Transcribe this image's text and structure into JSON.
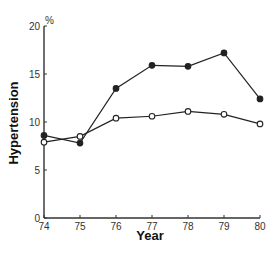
{
  "chart_data": {
    "type": "line",
    "title": "",
    "xlabel": "Year",
    "ylabel": "Hypertension",
    "y_unit": "%",
    "x": [
      74,
      75,
      76,
      77,
      78,
      79,
      80
    ],
    "x_tick_labels": [
      "74",
      "75",
      "76",
      "77",
      "78",
      "79",
      "80"
    ],
    "y_ticks": [
      0,
      5,
      10,
      15,
      20
    ],
    "y_tick_labels": [
      "0",
      "5",
      "10",
      "15",
      "20"
    ],
    "xlim": [
      74,
      80
    ],
    "ylim": [
      0,
      20
    ],
    "grid": false,
    "legend": null,
    "series": [
      {
        "name": "filled-circles",
        "marker": "filled",
        "values": [
          8.6,
          7.8,
          13.5,
          15.9,
          15.8,
          17.2,
          12.4
        ]
      },
      {
        "name": "open-circles",
        "marker": "open",
        "values": [
          7.9,
          8.5,
          10.4,
          10.6,
          11.1,
          10.8,
          9.8
        ]
      }
    ]
  },
  "colors": {
    "line": "#222222",
    "axis": "#333333"
  }
}
